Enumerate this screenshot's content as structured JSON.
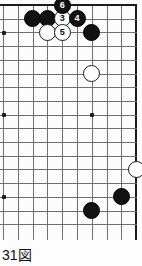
{
  "diagram": {
    "kind": "go-board-diagram",
    "caption": "31図",
    "caption_number": "31",
    "caption_suffix": "図",
    "colors": {
      "black_stone": "#121212",
      "white_stone": "#ffffff",
      "grid_line": "#6f6f72",
      "border_line": "#1a1a1a",
      "board_background": "#fcfcfc",
      "black_label_text": "#ffffff",
      "white_label_text": "#111111"
    },
    "board": {
      "visible_columns": 10,
      "visible_rows": 17,
      "origin_x": 3,
      "origin_y": 5,
      "spacing_x": 14.8,
      "spacing_y": 13.7,
      "top_edge_visible": true,
      "right_edge_visible": true,
      "left_edge_visible": false,
      "bottom_edge_visible": false
    },
    "star_points": [
      {
        "col": 0,
        "row": 2
      },
      {
        "col": 0,
        "row": 8
      },
      {
        "col": 6,
        "row": 8
      },
      {
        "col": 0,
        "row": 14
      }
    ],
    "stones": [
      {
        "id": "b-a",
        "color": "black",
        "label": "",
        "col": 2,
        "row": 1
      },
      {
        "id": "b-b",
        "color": "black",
        "label": "",
        "col": 3,
        "row": 1
      },
      {
        "id": "w-3",
        "color": "white",
        "label": "3",
        "col": 4,
        "row": 1
      },
      {
        "id": "b-4",
        "color": "black",
        "label": "4",
        "col": 5,
        "row": 1
      },
      {
        "id": "b-6",
        "color": "black",
        "label": "6",
        "col": 4,
        "row": 0
      },
      {
        "id": "w-c",
        "color": "white",
        "label": "",
        "col": 3,
        "row": 2
      },
      {
        "id": "w-5",
        "color": "white",
        "label": "5",
        "col": 4,
        "row": 2
      },
      {
        "id": "b-d",
        "color": "black",
        "label": "",
        "col": 6,
        "row": 2
      },
      {
        "id": "w-e",
        "color": "white",
        "label": "",
        "col": 6,
        "row": 5
      },
      {
        "id": "w-f",
        "color": "white",
        "label": "",
        "col": 9,
        "row": 12
      },
      {
        "id": "b-g",
        "color": "black",
        "label": "",
        "col": 8,
        "row": 14
      },
      {
        "id": "b-h",
        "color": "black",
        "label": "",
        "col": 6,
        "row": 15
      }
    ]
  }
}
